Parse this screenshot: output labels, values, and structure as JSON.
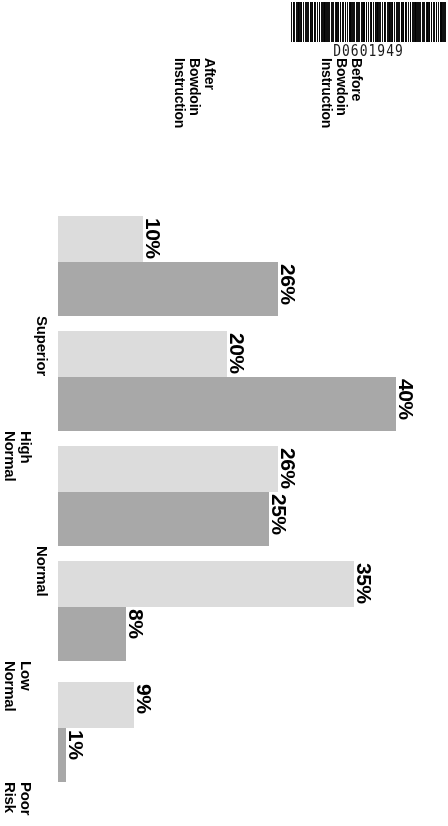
{
  "document": {
    "barcode": {
      "icon": "barcode-icon",
      "number": "D0601949"
    }
  },
  "legend": {
    "entries": [
      {
        "label": "Before Bowdoin\nInstruction",
        "color": "#dcdcdc",
        "key": "before"
      },
      {
        "label": "After Bowdoin\nInstruction",
        "color": "#a8a8a8",
        "key": "after"
      }
    ]
  },
  "chart_data": {
    "type": "bar",
    "orientation": "horizontal",
    "title": "",
    "xlabel": "",
    "ylabel": "",
    "categories": [
      "Superior",
      "High\nNormal",
      "Normal",
      "Low\nNormal",
      "Poor\nRisk"
    ],
    "series": [
      {
        "name": "Before Bowdoin Instruction",
        "color": "#dcdcdc",
        "values": [
          10,
          20,
          26,
          35,
          9
        ],
        "labels": [
          "10%",
          "20%",
          "26%",
          "35%",
          "9%"
        ]
      },
      {
        "name": "After Bowdoin Instruction",
        "color": "#a8a8a8",
        "values": [
          26,
          40,
          25,
          8,
          1
        ],
        "labels": [
          "26%",
          "40%",
          "25%",
          "8%",
          "1%"
        ]
      }
    ],
    "xlim": [
      0,
      45
    ],
    "grid": false,
    "legend_position": "top"
  }
}
